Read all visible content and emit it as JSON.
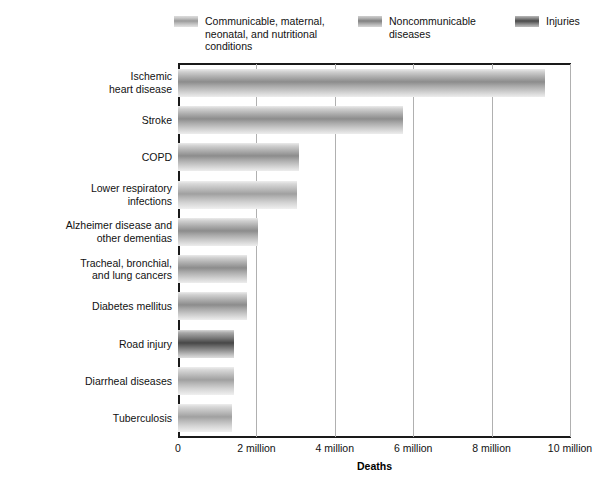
{
  "legend": {
    "position": "top",
    "items": [
      {
        "label": "Communicable, maternal,\nneonatal, and nutritional\nconditions",
        "key": "comm",
        "swatch": "legend-swatch-communicable"
      },
      {
        "label": "Noncommunicable\ndiseases",
        "key": "noncomm",
        "swatch": "legend-swatch-noncommunicable"
      },
      {
        "label": "Injuries",
        "key": "inj",
        "swatch": "legend-swatch-injuries"
      }
    ]
  },
  "axes": {
    "x_title": "Deaths",
    "x_ticks": [
      "0",
      "2 million",
      "4 million",
      "6 million",
      "8 million",
      "10 million"
    ]
  },
  "chart_data": {
    "type": "bar",
    "orientation": "horizontal",
    "title": "",
    "xlabel": "Deaths",
    "ylabel": "",
    "xlim": [
      0,
      10000000
    ],
    "xtick_values": [
      0,
      2000000,
      4000000,
      6000000,
      8000000,
      10000000
    ],
    "xtick_labels": [
      "0",
      "2 million",
      "4 million",
      "6 million",
      "8 million",
      "10 million"
    ],
    "grid": true,
    "legend_position": "top",
    "categories": [
      "Ischemic\nheart disease",
      "Stroke",
      "COPD",
      "Lower respiratory\ninfections",
      "Alzheimer disease and\nother dementias",
      "Tracheal, bronchial,\nand lung cancers",
      "Diabetes mellitus",
      "Road injury",
      "Diarrheal diseases",
      "Tuberculosis"
    ],
    "values": [
      9360000,
      5730000,
      3080000,
      3030000,
      2030000,
      1750000,
      1750000,
      1440000,
      1440000,
      1390000
    ],
    "groups": [
      "noncomm",
      "noncomm",
      "noncomm",
      "comm",
      "noncomm",
      "noncomm",
      "noncomm",
      "inj",
      "comm",
      "comm"
    ],
    "series": [
      {
        "name": "Communicable, maternal, neonatal, and nutritional conditions",
        "points": [
          {
            "category": "Lower respiratory infections",
            "value": 3030000
          },
          {
            "category": "Diarrheal diseases",
            "value": 1440000
          },
          {
            "category": "Tuberculosis",
            "value": 1390000
          }
        ]
      },
      {
        "name": "Noncommunicable diseases",
        "points": [
          {
            "category": "Ischemic heart disease",
            "value": 9360000
          },
          {
            "category": "Stroke",
            "value": 5730000
          },
          {
            "category": "COPD",
            "value": 3080000
          },
          {
            "category": "Alzheimer disease and other dementias",
            "value": 2030000
          },
          {
            "category": "Tracheal, bronchial, and lung cancers",
            "value": 1750000
          },
          {
            "category": "Diabetes mellitus",
            "value": 1750000
          }
        ]
      },
      {
        "name": "Injuries",
        "points": [
          {
            "category": "Road injury",
            "value": 1440000
          }
        ]
      }
    ]
  }
}
